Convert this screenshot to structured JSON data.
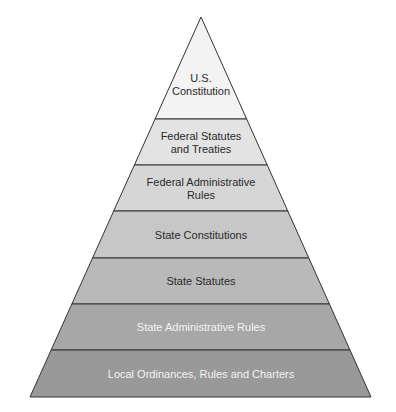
{
  "diagram": {
    "type": "pyramid",
    "apex": {
      "x": 201,
      "y": 17
    },
    "base": {
      "y": 397,
      "left_x": 30,
      "right_x": 371
    },
    "levels": [
      {
        "label_line1": "U.S.",
        "label_line2": "Constitution",
        "top": 17,
        "bottom": 119,
        "fill": "#f3f3f3",
        "text_color": "#2a2a2a"
      },
      {
        "label_line1": "Federal Statutes",
        "label_line2": "and Treaties",
        "top": 119,
        "bottom": 165,
        "fill": "#e3e3e3",
        "text_color": "#2a2a2a"
      },
      {
        "label_line1": "Federal Administrative",
        "label_line2": "Rules",
        "top": 165,
        "bottom": 211,
        "fill": "#d6d6d6",
        "text_color": "#2a2a2a"
      },
      {
        "label_line1": "State Constitutions",
        "label_line2": "",
        "top": 211,
        "bottom": 258,
        "fill": "#c7c7c7",
        "text_color": "#2a2a2a"
      },
      {
        "label_line1": "State Statutes",
        "label_line2": "",
        "top": 258,
        "bottom": 304,
        "fill": "#b9b9b9",
        "text_color": "#2a2a2a"
      },
      {
        "label_line1": "State Administrative Rules",
        "label_line2": "",
        "top": 304,
        "bottom": 350,
        "fill": "#a7a7a7",
        "text_color": "#f4f4f4"
      },
      {
        "label_line1": "Local Ordinances, Rules and Charters",
        "label_line2": "",
        "top": 350,
        "bottom": 397,
        "fill": "#999999",
        "text_color": "#f4f4f4"
      }
    ],
    "outline_color": "#333333"
  }
}
